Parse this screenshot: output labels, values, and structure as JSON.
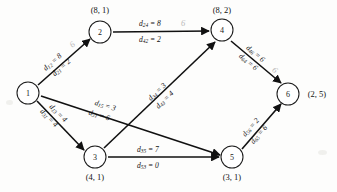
{
  "figure": {
    "background": "#fdfdfc",
    "ink_color": "#111111",
    "annotation_color": "#b9b9b9"
  },
  "nodes": [
    {
      "id": "1",
      "label": "1",
      "pair": "",
      "pair_position": "none",
      "cx": 28,
      "cy": 93
    },
    {
      "id": "2",
      "label": "2",
      "pair": "(8, 1)",
      "pair_position": "above",
      "cx": 100,
      "cy": 32
    },
    {
      "id": "3",
      "label": "3",
      "pair": "(4, 1)",
      "pair_position": "below",
      "cx": 95,
      "cy": 157
    },
    {
      "id": "4",
      "label": "4",
      "pair": "(8, 2)",
      "pair_position": "above",
      "cx": 222,
      "cy": 30
    },
    {
      "id": "5",
      "label": "5",
      "pair": "(3, 1)",
      "pair_position": "below",
      "cx": 232,
      "cy": 157
    },
    {
      "id": "6",
      "label": "6",
      "pair": "(2, 5)",
      "pair_position": "right",
      "cx": 288,
      "cy": 94
    }
  ],
  "edges": [
    {
      "id": "e12",
      "from": "1",
      "to": "2",
      "forward": {
        "symbol": "d",
        "sub": "12",
        "eq": "=",
        "value": "8"
      },
      "reverse": {
        "symbol": "d",
        "sub": "21",
        "eq": "=",
        "value": "2"
      },
      "handwritten_note": "6"
    },
    {
      "id": "e13",
      "from": "1",
      "to": "3",
      "forward": {
        "symbol": "d",
        "sub": "13",
        "eq": "=",
        "value": "4"
      },
      "reverse": {
        "symbol": "d",
        "sub": "31",
        "eq": "=",
        "value": "4"
      },
      "handwritten_note": ""
    },
    {
      "id": "e15",
      "from": "1",
      "to": "5",
      "forward": {
        "symbol": "d",
        "sub": "15",
        "eq": "=",
        "value": "3"
      },
      "reverse": {
        "symbol": "d",
        "sub": "51",
        "eq": "=",
        "value": "6"
      },
      "handwritten_note": ""
    },
    {
      "id": "e24",
      "from": "2",
      "to": "4",
      "forward": {
        "symbol": "d",
        "sub": "24",
        "eq": "=",
        "value": "8"
      },
      "reverse": {
        "symbol": "d",
        "sub": "42",
        "eq": "=",
        "value": "2"
      },
      "handwritten_note": "6"
    },
    {
      "id": "e34",
      "from": "3",
      "to": "4",
      "forward": {
        "symbol": "d",
        "sub": "34",
        "eq": "=",
        "value": "3"
      },
      "reverse": {
        "symbol": "d",
        "sub": "43",
        "eq": "=",
        "value": "4"
      },
      "handwritten_note": ""
    },
    {
      "id": "e35",
      "from": "3",
      "to": "5",
      "forward": {
        "symbol": "d",
        "sub": "35",
        "eq": "=",
        "value": "7"
      },
      "reverse": {
        "symbol": "d",
        "sub": "53",
        "eq": "=",
        "value": "0"
      },
      "handwritten_note": ""
    },
    {
      "id": "e46",
      "from": "4",
      "to": "6",
      "forward": {
        "symbol": "d",
        "sub": "46",
        "eq": "=",
        "value": "6"
      },
      "reverse": {
        "symbol": "d",
        "sub": "64",
        "eq": "=",
        "value": "6"
      },
      "handwritten_note": "6"
    },
    {
      "id": "e56",
      "from": "5",
      "to": "6",
      "forward": {
        "symbol": "d",
        "sub": "56",
        "eq": "=",
        "value": "2"
      },
      "reverse": {
        "symbol": "d",
        "sub": "65",
        "eq": "=",
        "value": "6"
      },
      "handwritten_note": ""
    }
  ]
}
